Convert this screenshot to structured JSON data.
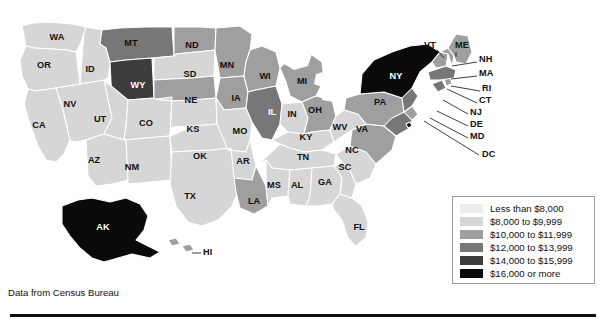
{
  "map": {
    "title": "US median household income by state",
    "credit": "Data from Census Bureau",
    "projection": "albers-usa"
  },
  "legend": {
    "title": "",
    "items": [
      {
        "label": "Less than $8,000",
        "color": "#ededed",
        "bin": 1
      },
      {
        "label": "$8,000 to $9,999",
        "color": "#d6d6d6",
        "bin": 2
      },
      {
        "label": "$10,000 to $11,999",
        "color": "#9f9f9f",
        "bin": 3
      },
      {
        "label": "$12,000 to $13,999",
        "color": "#777777",
        "bin": 4
      },
      {
        "label": "$14,000 to $15,999",
        "color": "#3c3c3c",
        "bin": 5
      },
      {
        "label": "$16,000 or more",
        "color": "#0a0a0a",
        "bin": 6
      }
    ]
  },
  "chart_data": {
    "type": "choropleth",
    "title": "",
    "xlabel": "",
    "ylabel": "",
    "unit": "US dollars",
    "value_field": "median household income bin",
    "legend_position": "bottom-right",
    "bins": [
      {
        "bin": 1,
        "label": "Less than $8,000",
        "color": "#ededed"
      },
      {
        "bin": 2,
        "label": "$8,000 to $9,999",
        "color": "#d6d6d6"
      },
      {
        "bin": 3,
        "label": "$10,000 to $11,999",
        "color": "#9f9f9f"
      },
      {
        "bin": 4,
        "label": "$12,000 to $13,999",
        "color": "#777777"
      },
      {
        "bin": 5,
        "label": "$14,000 to $15,999",
        "color": "#3c3c3c"
      },
      {
        "bin": 6,
        "label": "$16,000 or more",
        "color": "#0a0a0a"
      }
    ],
    "states": [
      {
        "code": "WA",
        "bin": 2
      },
      {
        "code": "OR",
        "bin": 2
      },
      {
        "code": "CA",
        "bin": 2
      },
      {
        "code": "NV",
        "bin": 2
      },
      {
        "code": "ID",
        "bin": 2
      },
      {
        "code": "MT",
        "bin": 4
      },
      {
        "code": "WY",
        "bin": 5
      },
      {
        "code": "UT",
        "bin": 2
      },
      {
        "code": "AZ",
        "bin": 2
      },
      {
        "code": "CO",
        "bin": 2
      },
      {
        "code": "NM",
        "bin": 2
      },
      {
        "code": "ND",
        "bin": 3
      },
      {
        "code": "SD",
        "bin": 2
      },
      {
        "code": "NE",
        "bin": 3
      },
      {
        "code": "KS",
        "bin": 2
      },
      {
        "code": "OK",
        "bin": 2
      },
      {
        "code": "TX",
        "bin": 2
      },
      {
        "code": "MN",
        "bin": 3
      },
      {
        "code": "IA",
        "bin": 3
      },
      {
        "code": "MO",
        "bin": 2
      },
      {
        "code": "AR",
        "bin": 2
      },
      {
        "code": "LA",
        "bin": 3
      },
      {
        "code": "WI",
        "bin": 3
      },
      {
        "code": "IL",
        "bin": 4
      },
      {
        "code": "MI",
        "bin": 3
      },
      {
        "code": "IN",
        "bin": 2
      },
      {
        "code": "OH",
        "bin": 3
      },
      {
        "code": "KY",
        "bin": 2
      },
      {
        "code": "TN",
        "bin": 2
      },
      {
        "code": "MS",
        "bin": 2
      },
      {
        "code": "AL",
        "bin": 2
      },
      {
        "code": "GA",
        "bin": 2
      },
      {
        "code": "FL",
        "bin": 2
      },
      {
        "code": "SC",
        "bin": 2
      },
      {
        "code": "NC",
        "bin": 2
      },
      {
        "code": "VA",
        "bin": 3
      },
      {
        "code": "WV",
        "bin": 2
      },
      {
        "code": "PA",
        "bin": 3
      },
      {
        "code": "MD",
        "bin": 4
      },
      {
        "code": "DE",
        "bin": 3
      },
      {
        "code": "NJ",
        "bin": 4
      },
      {
        "code": "NY",
        "bin": 6
      },
      {
        "code": "CT",
        "bin": 4
      },
      {
        "code": "RI",
        "bin": 3
      },
      {
        "code": "MA",
        "bin": 4
      },
      {
        "code": "VT",
        "bin": 3
      },
      {
        "code": "NH",
        "bin": 3
      },
      {
        "code": "ME",
        "bin": 3
      },
      {
        "code": "AK",
        "bin": 6
      },
      {
        "code": "HI",
        "bin": 3
      },
      {
        "code": "DC",
        "bin": 6
      }
    ]
  },
  "labels": {
    "inline": [
      {
        "code": "WA",
        "text": "WA",
        "x": 57,
        "y": 38,
        "dark": false
      },
      {
        "code": "OR",
        "text": "OR",
        "x": 44,
        "y": 66,
        "dark": false
      },
      {
        "code": "CA",
        "text": "CA",
        "x": 39,
        "y": 126,
        "dark": false
      },
      {
        "code": "NV",
        "text": "NV",
        "x": 70,
        "y": 105,
        "dark": false
      },
      {
        "code": "ID",
        "text": "ID",
        "x": 90,
        "y": 70,
        "dark": false
      },
      {
        "code": "MT",
        "text": "MT",
        "x": 131,
        "y": 44,
        "dark": false
      },
      {
        "code": "WY",
        "text": "WY",
        "x": 138,
        "y": 86,
        "dark": true
      },
      {
        "code": "UT",
        "text": "UT",
        "x": 100,
        "y": 120,
        "dark": false
      },
      {
        "code": "AZ",
        "text": "AZ",
        "x": 94,
        "y": 161,
        "dark": false
      },
      {
        "code": "CO",
        "text": "CO",
        "x": 146,
        "y": 124,
        "dark": false
      },
      {
        "code": "NM",
        "text": "NM",
        "x": 132,
        "y": 168,
        "dark": false
      },
      {
        "code": "ND",
        "text": "ND",
        "x": 192,
        "y": 46,
        "dark": false
      },
      {
        "code": "SD",
        "text": "SD",
        "x": 190,
        "y": 75,
        "dark": false
      },
      {
        "code": "NE",
        "text": "NE",
        "x": 191,
        "y": 101,
        "dark": false
      },
      {
        "code": "KS",
        "text": "KS",
        "x": 193,
        "y": 130,
        "dark": false
      },
      {
        "code": "OK",
        "text": "OK",
        "x": 200,
        "y": 157,
        "dark": false
      },
      {
        "code": "TX",
        "text": "TX",
        "x": 190,
        "y": 197,
        "dark": false
      },
      {
        "code": "MN",
        "text": "MN",
        "x": 227,
        "y": 66,
        "dark": false
      },
      {
        "code": "IA",
        "text": "IA",
        "x": 236,
        "y": 99,
        "dark": false
      },
      {
        "code": "MO",
        "text": "MO",
        "x": 240,
        "y": 132,
        "dark": false
      },
      {
        "code": "AR",
        "text": "AR",
        "x": 243,
        "y": 162,
        "dark": false
      },
      {
        "code": "LA",
        "text": "LA",
        "x": 254,
        "y": 202,
        "dark": false
      },
      {
        "code": "WI",
        "text": "WI",
        "x": 265,
        "y": 77,
        "dark": false
      },
      {
        "code": "IL",
        "text": "IL",
        "x": 272,
        "y": 113,
        "dark": true
      },
      {
        "code": "MI",
        "text": "MI",
        "x": 302,
        "y": 82,
        "dark": false
      },
      {
        "code": "IN",
        "text": "IN",
        "x": 292,
        "y": 115,
        "dark": false
      },
      {
        "code": "OH",
        "text": "OH",
        "x": 315,
        "y": 111,
        "dark": false
      },
      {
        "code": "KY",
        "text": "KY",
        "x": 306,
        "y": 138,
        "dark": false
      },
      {
        "code": "TN",
        "text": "TN",
        "x": 303,
        "y": 158,
        "dark": false
      },
      {
        "code": "MS",
        "text": "MS",
        "x": 274,
        "y": 186,
        "dark": false
      },
      {
        "code": "AL",
        "text": "AL",
        "x": 297,
        "y": 186,
        "dark": false
      },
      {
        "code": "GA",
        "text": "GA",
        "x": 325,
        "y": 183,
        "dark": false
      },
      {
        "code": "FL",
        "text": "FL",
        "x": 359,
        "y": 228,
        "dark": false
      },
      {
        "code": "SC",
        "text": "SC",
        "x": 345,
        "y": 168,
        "dark": false
      },
      {
        "code": "NC",
        "text": "NC",
        "x": 352,
        "y": 151,
        "dark": false
      },
      {
        "code": "VA",
        "text": "VA",
        "x": 362,
        "y": 130,
        "dark": false
      },
      {
        "code": "WV",
        "text": "WV",
        "x": 340,
        "y": 128,
        "dark": false
      },
      {
        "code": "PA",
        "text": "PA",
        "x": 380,
        "y": 103,
        "dark": false
      },
      {
        "code": "NY",
        "text": "NY",
        "x": 396,
        "y": 77,
        "dark": true
      },
      {
        "code": "AK",
        "text": "AK",
        "x": 103,
        "y": 228,
        "dark": true
      }
    ],
    "callouts": [
      {
        "code": "VT",
        "text": "VT",
        "tx": 424,
        "ty": 46,
        "lx1": 437,
        "ly1": 50,
        "lx2": 444,
        "ly2": 58
      },
      {
        "code": "ME",
        "text": "ME",
        "tx": 455,
        "ty": 46,
        "lx1": 456,
        "ly1": 52,
        "lx2": 456,
        "ly2": 57
      },
      {
        "code": "NH",
        "text": "NH",
        "tx": 479,
        "ty": 60,
        "lx1": 477,
        "ly1": 62,
        "lx2": 452,
        "ly2": 66
      },
      {
        "code": "MA",
        "text": "MA",
        "tx": 479,
        "ty": 74,
        "lx1": 477,
        "ly1": 76,
        "lx2": 451,
        "ly2": 79
      },
      {
        "code": "RI",
        "text": "RI",
        "tx": 482,
        "ty": 89,
        "lx1": 480,
        "ly1": 91,
        "lx2": 451,
        "ly2": 86
      },
      {
        "code": "CT",
        "text": "CT",
        "tx": 479,
        "ty": 101,
        "lx1": 477,
        "ly1": 103,
        "lx2": 447,
        "ly2": 89
      },
      {
        "code": "NJ",
        "text": "NJ",
        "tx": 470,
        "ty": 113,
        "lx1": 468,
        "ly1": 114,
        "lx2": 443,
        "ly2": 100
      },
      {
        "code": "DE",
        "text": "DE",
        "tx": 470,
        "ty": 125,
        "lx1": 468,
        "ly1": 126,
        "lx2": 437,
        "ly2": 111
      },
      {
        "code": "MD",
        "text": "MD",
        "tx": 470,
        "ty": 137,
        "lx1": 468,
        "ly1": 138,
        "lx2": 430,
        "ly2": 118
      },
      {
        "code": "DC",
        "text": "DC",
        "tx": 482,
        "ty": 155,
        "lx1": 479,
        "ly1": 155,
        "lx2": 424,
        "ly2": 121
      },
      {
        "code": "HI",
        "text": "HI",
        "tx": 203,
        "ty": 253,
        "lx1": 201,
        "ly1": 253,
        "lx2": 192,
        "ly2": 253
      }
    ]
  }
}
